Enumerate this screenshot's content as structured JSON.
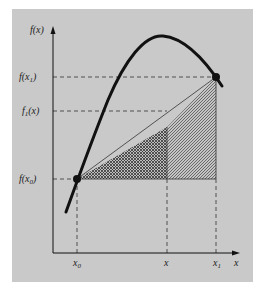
{
  "figure": {
    "panel_color": "#c9c9c9",
    "ink_color": "#111111",
    "y_axis": {
      "label": "f(x)"
    },
    "x_axis": {
      "label": "x"
    },
    "y_ticks": [
      {
        "label": "f(x",
        "sub": "1",
        "suffix": ")",
        "name": "f-x1"
      },
      {
        "label": "f",
        "sub": "1",
        "suffix": "(x)",
        "name": "f1-x"
      },
      {
        "label": "f(x",
        "sub": "0",
        "suffix": ")",
        "name": "f-x0"
      }
    ],
    "x_ticks": [
      {
        "label": "x",
        "sub": "0",
        "name": "x0"
      },
      {
        "label": "x",
        "sub": "",
        "name": "x"
      },
      {
        "label": "x",
        "sub": "1",
        "name": "x1"
      }
    ],
    "points": [
      {
        "name": "point-x0-fx0",
        "x": 77,
        "y": 179
      },
      {
        "name": "point-x1-fx1",
        "x": 216,
        "y": 77
      }
    ],
    "regions": [
      {
        "name": "crosshatched-triangle",
        "pattern": "crosshatch"
      },
      {
        "name": "diagonal-hatched-trapezoid",
        "pattern": "diagonal"
      }
    ]
  }
}
